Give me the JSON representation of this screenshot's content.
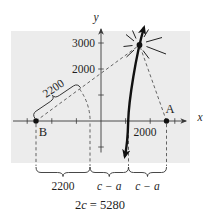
{
  "colors": {
    "panel": "#ececec",
    "ink": "#1f1f1f",
    "dash_line": "#4a4a4a",
    "curve": "#111111"
  },
  "axes": {
    "x_label": "x",
    "y_label": "y"
  },
  "y_ticks": {
    "t3000": "3000",
    "t2000": "2000"
  },
  "x_ticks": {
    "t2000": "2000"
  },
  "points": {
    "a": "A",
    "b": "B"
  },
  "distances": {
    "slant": "2200"
  },
  "braces": {
    "left": "2200",
    "mid": "c − a",
    "right": "c − a"
  },
  "equation": {
    "coef": "2",
    "var": "c",
    "rest": "= 5280"
  }
}
